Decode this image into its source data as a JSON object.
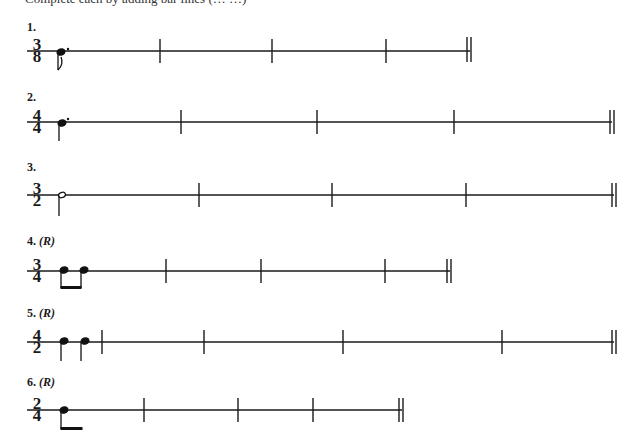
{
  "header": {
    "text": "Complete each by adding bar lines (… …)"
  },
  "exercises": [
    {
      "label": "1.",
      "rhythm_marker": "",
      "time_signature": {
        "top": "3",
        "bottom": "8"
      },
      "notes": "dotted eighth note",
      "staff_y": 51,
      "staff_end": 470,
      "barlines": [
        160,
        272,
        386
      ]
    },
    {
      "label": "2.",
      "rhythm_marker": "",
      "time_signature": {
        "top": "4",
        "bottom": "4"
      },
      "notes": "dotted quarter note",
      "staff_y": 122,
      "staff_end": 612,
      "barlines": [
        181,
        317,
        454
      ]
    },
    {
      "label": "3.",
      "rhythm_marker": "",
      "time_signature": {
        "top": "3",
        "bottom": "2"
      },
      "notes": "half note",
      "staff_y": 195,
      "staff_end": 614,
      "barlines": [
        199,
        332,
        466
      ]
    },
    {
      "label": "4.",
      "rhythm_marker": "(R)",
      "time_signature": {
        "top": "3",
        "bottom": "4"
      },
      "notes": "two beamed eighth notes",
      "staff_y": 271,
      "staff_end": 450,
      "barlines": [
        166,
        261,
        385
      ]
    },
    {
      "label": "5.",
      "rhythm_marker": "(R)",
      "time_signature": {
        "top": "4",
        "bottom": "2"
      },
      "notes": "two quarter notes",
      "staff_y": 342,
      "staff_end": 614,
      "barlines": [
        102,
        204,
        343,
        502
      ]
    },
    {
      "label": "6.",
      "rhythm_marker": "(R)",
      "time_signature": {
        "top": "2",
        "bottom": "4"
      },
      "notes": "eighth note with beam",
      "staff_y": 410,
      "staff_end": 402,
      "barlines": [
        144,
        238,
        313
      ]
    }
  ]
}
